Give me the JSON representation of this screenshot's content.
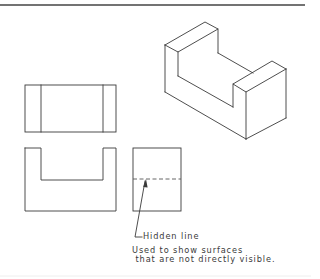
{
  "figure": {
    "views": [
      {
        "name": "isometric",
        "label": ""
      },
      {
        "name": "top",
        "label": ""
      },
      {
        "name": "front",
        "label": ""
      },
      {
        "name": "side",
        "label": ""
      }
    ],
    "annotation": {
      "callout": "Hidden line",
      "note_line_1": "Used to show surfaces",
      "note_line_2": " that are not directly visible."
    },
    "colors": {
      "line": "#3a3a3a",
      "background": "#ffffff"
    }
  }
}
